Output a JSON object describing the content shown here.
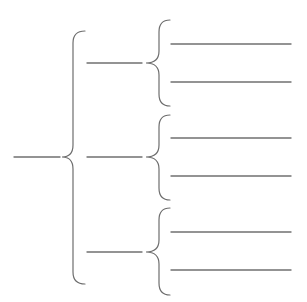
{
  "diagram": {
    "type": "brace-tree",
    "stroke_color": "#6e6e6e",
    "line_color": "#707070",
    "background": "#ffffff",
    "root": {
      "label": "",
      "line": {
        "x1": 14,
        "x2": 60,
        "y": 157
      }
    },
    "main_brace": {
      "x": 73,
      "top": 31,
      "bottom": 284,
      "mid": 157,
      "tip_x": 62,
      "cap_x": 85
    },
    "branches": [
      {
        "label": "",
        "line": {
          "x1": 87,
          "x2": 142,
          "y": 63
        },
        "brace": {
          "x": 159,
          "top": 20,
          "bottom": 106,
          "mid": 63,
          "tip_x": 146,
          "cap_x": 170
        },
        "leaves": [
          {
            "label": "",
            "line": {
              "x1": 171,
              "x2": 291,
              "y": 44
            }
          },
          {
            "label": "",
            "line": {
              "x1": 171,
              "x2": 291,
              "y": 82
            }
          }
        ]
      },
      {
        "label": "",
        "line": {
          "x1": 87,
          "x2": 142,
          "y": 157
        },
        "brace": {
          "x": 159,
          "top": 115,
          "bottom": 200,
          "mid": 157,
          "tip_x": 146,
          "cap_x": 170
        },
        "leaves": [
          {
            "label": "",
            "line": {
              "x1": 171,
              "x2": 291,
              "y": 138
            }
          },
          {
            "label": "",
            "line": {
              "x1": 171,
              "x2": 291,
              "y": 176
            }
          }
        ]
      },
      {
        "label": "",
        "line": {
          "x1": 87,
          "x2": 142,
          "y": 252
        },
        "brace": {
          "x": 159,
          "top": 208,
          "bottom": 295,
          "mid": 252,
          "tip_x": 146,
          "cap_x": 170
        },
        "leaves": [
          {
            "label": "",
            "line": {
              "x1": 171,
              "x2": 291,
              "y": 232
            }
          },
          {
            "label": "",
            "line": {
              "x1": 171,
              "x2": 291,
              "y": 270
            }
          }
        ]
      }
    ]
  }
}
